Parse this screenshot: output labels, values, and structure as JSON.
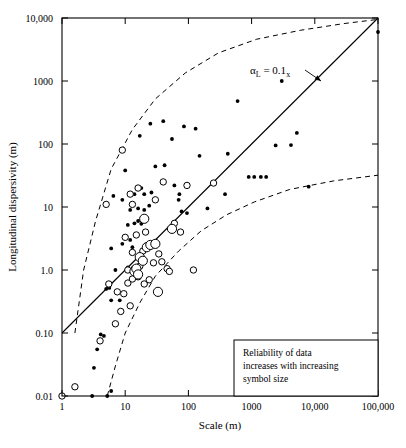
{
  "chart_data": {
    "type": "scatter",
    "title": "",
    "xlabel": "Scale (m)",
    "ylabel": "Longitudinal dispersivity (m)",
    "xscale": "log",
    "yscale": "log",
    "xlim": [
      1,
      100000
    ],
    "ylim": [
      0.01,
      10000
    ],
    "grid": false,
    "legend_position": "inside-bottom-right",
    "xticks": [
      1,
      10,
      100,
      1000,
      10000,
      100000
    ],
    "xtick_labels": [
      "1",
      "10",
      "100",
      "1000",
      "10,000",
      "100,000"
    ],
    "yticks": [
      0.01,
      0.1,
      1,
      10,
      100,
      1000,
      10000
    ],
    "ytick_labels": [
      "0.01",
      "0.10",
      "1.0",
      "10",
      "100",
      "1000",
      "10,000"
    ],
    "annotations": [
      {
        "name": "alpha-relation",
        "text_main": "α",
        "text_sub": "L",
        "text_rest": " = 0.1",
        "text_rest_sub": "x",
        "full_text": "αL = 0.1x",
        "x": 900,
        "y": 1400
      }
    ],
    "legend_note": {
      "line1": "Reliability of data",
      "line2": "increases with increasing",
      "line3": "symbol size"
    },
    "series": [
      {
        "name": "fit-line",
        "type": "line",
        "style": "solid",
        "label": "αL = 0.1x",
        "points": [
          [
            1,
            0.1
          ],
          [
            100000,
            10000
          ]
        ]
      },
      {
        "name": "upper-envelope",
        "type": "line",
        "style": "dashed",
        "points": [
          [
            1.6,
            0.1
          ],
          [
            2.2,
            1
          ],
          [
            3.4,
            6
          ],
          [
            6,
            40
          ],
          [
            13,
            170
          ],
          [
            30,
            520
          ],
          [
            90,
            1350
          ],
          [
            300,
            2800
          ],
          [
            1200,
            4600
          ],
          [
            6000,
            6400
          ],
          [
            30000,
            8200
          ],
          [
            100000,
            9500
          ]
        ]
      },
      {
        "name": "lower-envelope",
        "type": "line",
        "style": "dashed",
        "points": [
          [
            5.2,
            0.01
          ],
          [
            7,
            0.03
          ],
          [
            10,
            0.1
          ],
          [
            17,
            0.3
          ],
          [
            30,
            0.8
          ],
          [
            70,
            2.0
          ],
          [
            160,
            4.2
          ],
          [
            400,
            7.5
          ],
          [
            1100,
            12
          ],
          [
            4000,
            19
          ],
          [
            20000,
            26
          ],
          [
            100000,
            32
          ]
        ]
      },
      {
        "name": "low-reliability-filled",
        "type": "scatter",
        "marker": "filled-circle",
        "size": "small",
        "points": [
          [
            3.0,
            0.01
          ],
          [
            5.2,
            0.01
          ],
          [
            6.0,
            0.012
          ],
          [
            3.2,
            0.028
          ],
          [
            3.6,
            0.055
          ],
          [
            4.1,
            0.095
          ],
          [
            4.6,
            0.09
          ],
          [
            6.0,
            0.33
          ],
          [
            5.0,
            0.5
          ],
          [
            5.6,
            0.52
          ],
          [
            8.2,
            0.33
          ],
          [
            7.0,
            1.0
          ],
          [
            11,
            1.1
          ],
          [
            6.0,
            2.2
          ],
          [
            9.0,
            2.6
          ],
          [
            12,
            3.0
          ],
          [
            13,
            2.3
          ],
          [
            11,
            5.2
          ],
          [
            14,
            5.5
          ],
          [
            16,
            6.0
          ],
          [
            18,
            5.4
          ],
          [
            12,
            9.0
          ],
          [
            16,
            9.5
          ],
          [
            20,
            9.0
          ],
          [
            24,
            10.5
          ],
          [
            14,
            16
          ],
          [
            20,
            16
          ],
          [
            26,
            17
          ],
          [
            18,
            20
          ],
          [
            9.0,
            13
          ],
          [
            6.5,
            15
          ],
          [
            10,
            38
          ],
          [
            17,
            135
          ],
          [
            25,
            210
          ],
          [
            40,
            230
          ],
          [
            30,
            44
          ],
          [
            42,
            46
          ],
          [
            55,
            120
          ],
          [
            60,
            22
          ],
          [
            70,
            13
          ],
          [
            72,
            16
          ],
          [
            78,
            8.5
          ],
          [
            95,
            8.0
          ],
          [
            85,
            190
          ],
          [
            130,
            175
          ],
          [
            150,
            65
          ],
          [
            200,
            9.5
          ],
          [
            380,
            16
          ],
          [
            420,
            70
          ],
          [
            600,
            480
          ],
          [
            900,
            30
          ],
          [
            1100,
            30
          ],
          [
            1400,
            30
          ],
          [
            1700,
            30
          ],
          [
            2400,
            95
          ],
          [
            4200,
            96
          ],
          [
            5200,
            150
          ],
          [
            3000,
            1000
          ],
          [
            8000,
            21
          ],
          [
            100000,
            6000
          ]
        ]
      },
      {
        "name": "medium-reliability-open",
        "type": "scatter",
        "marker": "open-circle",
        "size": "medium",
        "points": [
          [
            1.0,
            0.01
          ],
          [
            1.6,
            0.014
          ],
          [
            4.0,
            0.075
          ],
          [
            7.0,
            0.14
          ],
          [
            8.5,
            0.22
          ],
          [
            12,
            0.27
          ],
          [
            5.5,
            0.6
          ],
          [
            7.5,
            0.45
          ],
          [
            9.5,
            0.42
          ],
          [
            11,
            0.62
          ],
          [
            13,
            0.72
          ],
          [
            16,
            0.78
          ],
          [
            20,
            0.6
          ],
          [
            24,
            0.7
          ],
          [
            11,
            1.0
          ],
          [
            14,
            1.05
          ],
          [
            17,
            1.15
          ],
          [
            28,
            1.3
          ],
          [
            38,
            1.35
          ],
          [
            46,
            1.05
          ],
          [
            50,
            0.95
          ],
          [
            120,
            1.0
          ],
          [
            13,
            1.9
          ],
          [
            19,
            2.0
          ],
          [
            22,
            2.4
          ],
          [
            34,
            1.8
          ],
          [
            10,
            3.3
          ],
          [
            15,
            3.6
          ],
          [
            21,
            4.0
          ],
          [
            13,
            11
          ],
          [
            16,
            20
          ],
          [
            12,
            16
          ],
          [
            5.0,
            11
          ],
          [
            9.0,
            80
          ],
          [
            30,
            13
          ],
          [
            40,
            25
          ],
          [
            95,
            22
          ],
          [
            250,
            24
          ],
          [
            60,
            5.5
          ],
          [
            75,
            4.0
          ]
        ]
      },
      {
        "name": "high-reliability-large-open",
        "type": "scatter",
        "marker": "open-circle",
        "size": "large",
        "points": [
          [
            14,
            0.95
          ],
          [
            15,
            1.05
          ],
          [
            16,
            0.85
          ],
          [
            17,
            1.6
          ],
          [
            19,
            1.4
          ],
          [
            22,
            2.3
          ],
          [
            25,
            2.5
          ],
          [
            30,
            2.6
          ],
          [
            20,
            6.5
          ],
          [
            55,
            4.5
          ],
          [
            33,
            0.45
          ]
        ]
      }
    ]
  },
  "axes": {
    "x_title": "Scale (m)",
    "y_title": "Longitudinal dispersivity (m)"
  }
}
